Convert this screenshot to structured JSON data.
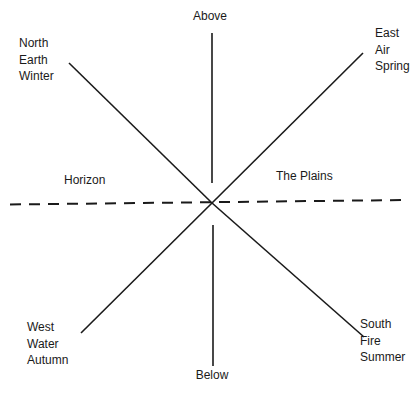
{
  "diagram": {
    "vertical": {
      "top_label": "Above",
      "bottom_label": "Below"
    },
    "horizon_label": "Horizon",
    "plains_label": "The Plains",
    "quadrants": {
      "northwest": [
        "North",
        "Earth",
        "Winter"
      ],
      "northeast": [
        "East",
        "Air",
        "Spring"
      ],
      "southwest": [
        "West",
        "Water",
        "Autumn"
      ],
      "southeast": [
        "South",
        "Fire",
        "Summer"
      ]
    },
    "colors": {
      "line": "#1a1a1a",
      "background": "#ffffff"
    }
  }
}
